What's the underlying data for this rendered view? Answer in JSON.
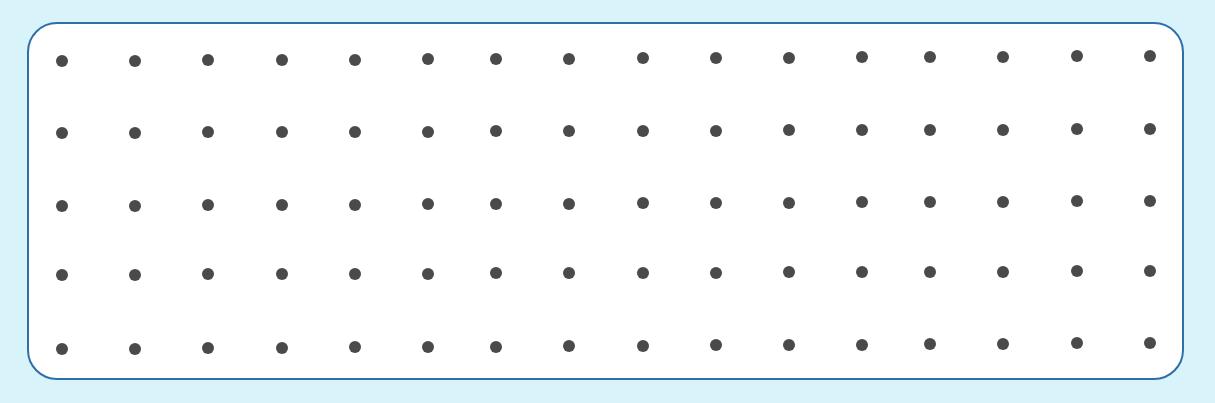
{
  "board": {
    "type": "dot-grid",
    "rows": 5,
    "columns": 16,
    "colors": {
      "background": "#d9f3fb",
      "board_fill": "#ffffff",
      "border": "#2f6fa8",
      "dot": "#4a4a4a"
    },
    "column_x": [
      62,
      135,
      208,
      282,
      355,
      428,
      496,
      569,
      643,
      716,
      789,
      862,
      930,
      1003,
      1077,
      1150
    ],
    "row_y_left": [
      61,
      133,
      206,
      275,
      349
    ],
    "row_y_right": [
      56,
      129,
      201,
      271,
      343
    ]
  }
}
